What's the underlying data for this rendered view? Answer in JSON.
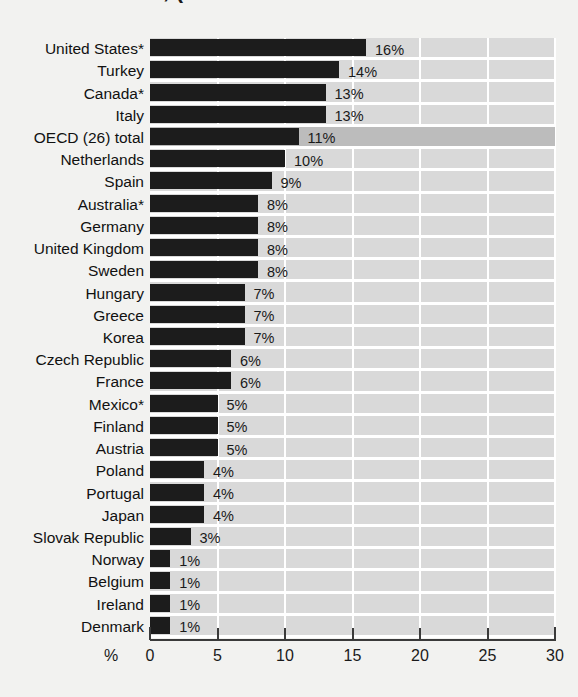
{
  "title": {
    "cropped_remnant": ", ("
  },
  "axis": {
    "unit_label": "%",
    "ticks": [
      0,
      5,
      10,
      15,
      20,
      25,
      30
    ],
    "tick_labels": [
      "0",
      "5",
      "10",
      "15",
      "20",
      "25",
      "30"
    ]
  },
  "colors": {
    "bar": "#1c1c1c",
    "plot_background": "#d9d9d9",
    "highlight_row": "#bcbcbc",
    "gridline": "#ffffff",
    "axis": "#3a3a3a",
    "page_background": "#f2f2f0"
  },
  "chart_data": {
    "type": "bar",
    "orientation": "horizontal",
    "title": "",
    "xlabel": "%",
    "ylabel": "",
    "xlim": [
      0,
      30
    ],
    "grid": true,
    "legend": false,
    "categories": [
      "United States*",
      "Turkey",
      "Canada*",
      "Italy",
      "OECD (26) total",
      "Netherlands",
      "Spain",
      "Australia*",
      "Germany",
      "United Kingdom",
      "Sweden",
      "Hungary",
      "Greece",
      "Korea",
      "Czech Republic",
      "France",
      "Mexico*",
      "Finland",
      "Austria",
      "Poland",
      "Portugal",
      "Japan",
      "Slovak Republic",
      "Norway",
      "Belgium",
      "Ireland",
      "Denmark"
    ],
    "values": [
      16,
      14,
      13,
      13,
      11,
      10,
      9,
      8,
      8,
      8,
      8,
      7,
      7,
      7,
      6,
      6,
      5,
      5,
      5,
      4,
      4,
      4,
      3,
      1,
      1,
      1,
      1
    ],
    "value_labels": [
      "16%",
      "14%",
      "13%",
      "13%",
      "11%",
      "10%",
      "9%",
      "8%",
      "8%",
      "8%",
      "8%",
      "7%",
      "7%",
      "7%",
      "6%",
      "6%",
      "5%",
      "5%",
      "5%",
      "4%",
      "4%",
      "4%",
      "3%",
      "1%",
      "1%",
      "1%",
      "1%"
    ],
    "bar_extent": [
      16,
      14,
      13,
      13,
      11,
      10,
      9,
      8,
      8,
      8,
      8,
      7,
      7,
      7,
      6,
      6,
      5,
      5,
      5,
      4,
      4,
      4,
      3,
      1.5,
      1.5,
      1.5,
      1.5
    ],
    "highlight_index": 4
  }
}
